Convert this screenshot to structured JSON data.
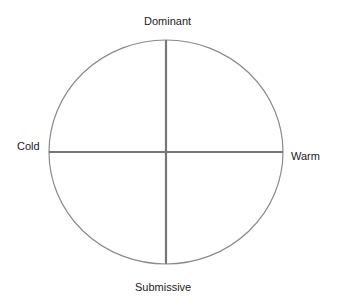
{
  "diagram": {
    "type": "interpersonal-circumplex",
    "labels": {
      "top": "Dominant",
      "left": "Cold",
      "right": "Warm",
      "bottom": "Submissive"
    },
    "colors": {
      "outline": "#8a8a8a",
      "axes": "#777777",
      "text": "#222222"
    }
  }
}
